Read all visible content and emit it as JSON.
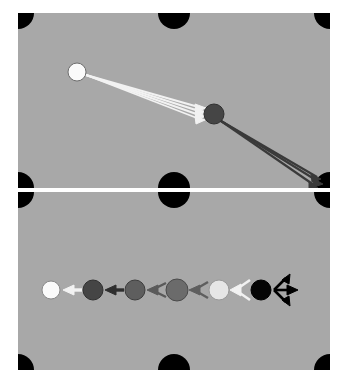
{
  "figure": {
    "title": "",
    "background_color": "#ffffff",
    "panel_color": "#a8a8a8",
    "divider_color": "#ffffff",
    "marker_color": "#000000",
    "panel_count": 2,
    "panel_width": 312,
    "panel_height_top": 175,
    "panel_height_bottom": 178
  },
  "chart_data": {
    "type": "diagram",
    "title": "",
    "xlabel": "",
    "ylabel": "",
    "panels": [
      {
        "name": "top-panel",
        "label": "",
        "corner_markers": [
          {
            "name": "marker-top-left",
            "shape": "quarter-circle",
            "x": 0,
            "y": 0,
            "radius": 16,
            "color": "#000000"
          },
          {
            "name": "marker-top-center",
            "shape": "half-circle",
            "x": 156,
            "y": 0,
            "radius": 16,
            "color": "#000000"
          },
          {
            "name": "marker-top-right",
            "shape": "quarter-circle",
            "x": 312,
            "y": 0,
            "radius": 16,
            "color": "#000000"
          },
          {
            "name": "marker-bottom-left",
            "shape": "quarter-circle",
            "x": 0,
            "y": 175,
            "radius": 16,
            "color": "#000000"
          },
          {
            "name": "marker-bottom-center",
            "shape": "half-circle",
            "x": 156,
            "y": 175,
            "radius": 16,
            "color": "#000000"
          },
          {
            "name": "marker-bottom-right",
            "shape": "quarter-circle",
            "x": 312,
            "y": 175,
            "radius": 16,
            "color": "#000000"
          }
        ],
        "nodes": [
          {
            "name": "node-source-white",
            "x": 59,
            "y": 59,
            "radius": 9,
            "fill": "#fafafa",
            "stroke": "#6e6e6e"
          },
          {
            "name": "node-hub-dark",
            "x": 196,
            "y": 101,
            "radius": 10,
            "fill": "#454545",
            "stroke": "#303030"
          }
        ],
        "light_arrows": {
          "name": "white-arrow-bundle",
          "color": "#f2f2f2",
          "count": 4,
          "origin": {
            "x": 68,
            "y": 62
          },
          "targets": [
            {
              "x": 186,
              "y": 96
            },
            {
              "x": 186,
              "y": 99
            },
            {
              "x": 186,
              "y": 102
            },
            {
              "x": 186,
              "y": 105
            }
          ]
        },
        "dark_arrows": {
          "name": "dark-arrow-bundle",
          "color": "#3a3a3a",
          "count": 3,
          "origin": {
            "x": 204,
            "y": 108
          },
          "targets": [
            {
              "x": 303,
              "y": 166
            },
            {
              "x": 305,
              "y": 171
            },
            {
              "x": 300,
              "y": 174
            }
          ]
        }
      },
      {
        "name": "bottom-panel",
        "label": "",
        "corner_markers": [
          {
            "name": "marker-top-left",
            "shape": "quarter-circle",
            "x": 0,
            "y": 0,
            "radius": 16,
            "color": "#000000"
          },
          {
            "name": "marker-top-center",
            "shape": "half-circle",
            "x": 156,
            "y": 0,
            "radius": 16,
            "color": "#000000"
          },
          {
            "name": "marker-top-right",
            "shape": "quarter-circle",
            "x": 312,
            "y": 0,
            "radius": 16,
            "color": "#000000"
          },
          {
            "name": "marker-bottom-left",
            "shape": "quarter-circle",
            "x": 0,
            "y": 178,
            "radius": 16,
            "color": "#000000"
          },
          {
            "name": "marker-bottom-center",
            "shape": "half-circle",
            "x": 156,
            "y": 178,
            "radius": 16,
            "color": "#000000"
          },
          {
            "name": "marker-bottom-right",
            "shape": "quarter-circle",
            "x": 312,
            "y": 178,
            "radius": 16,
            "color": "#000000"
          }
        ],
        "sequence_y": 98,
        "nodes": [
          {
            "name": "node-1-white",
            "index": 1,
            "x": 33,
            "radius": 9,
            "fill": "#fafafa",
            "stroke": "#8a8a8a"
          },
          {
            "name": "node-2-darkgray",
            "index": 2,
            "x": 75,
            "radius": 10,
            "fill": "#454545",
            "stroke": "#303030"
          },
          {
            "name": "node-3-gray",
            "index": 3,
            "x": 117,
            "radius": 10,
            "fill": "#5e5e5e",
            "stroke": "#3d3d3d"
          },
          {
            "name": "node-4-midgray",
            "index": 4,
            "x": 159,
            "radius": 11,
            "fill": "#6b6b6b",
            "stroke": "#4a4a4a"
          },
          {
            "name": "node-5-lightgray",
            "index": 5,
            "x": 201,
            "radius": 10,
            "fill": "#e6e6e6",
            "stroke": "#9a9a9a"
          },
          {
            "name": "node-6-black",
            "index": 6,
            "x": 243,
            "radius": 10,
            "fill": "#050505",
            "stroke": "#000000"
          }
        ],
        "arrows": [
          {
            "name": "arrow-1-white",
            "index": 1,
            "style": "solid-shaft",
            "color": "#f2f2f2",
            "from_x": 64,
            "to_x": 46,
            "spread": 0
          },
          {
            "name": "arrow-2-dark",
            "index": 2,
            "style": "solid-shaft",
            "color": "#2e2e2e",
            "from_x": 106,
            "to_x": 88,
            "spread": 0
          },
          {
            "name": "arrow-3-chevron",
            "index": 3,
            "style": "fan",
            "color": "#5a5a5a",
            "from_x": 148,
            "to_x": 130,
            "spread": 7
          },
          {
            "name": "arrow-4-chevron",
            "index": 4,
            "style": "fan",
            "color": "#5e5e5e",
            "from_x": 190,
            "to_x": 172,
            "spread": 8
          },
          {
            "name": "arrow-5-chevron",
            "index": 5,
            "style": "fan",
            "color": "#f2f2f2",
            "from_x": 232,
            "to_x": 212,
            "spread": 9
          },
          {
            "name": "arrow-6-black-fan",
            "index": 6,
            "style": "fan-right",
            "color": "#000000",
            "from_x": 254,
            "to_x": 278,
            "spread": 11
          }
        ]
      }
    ]
  }
}
